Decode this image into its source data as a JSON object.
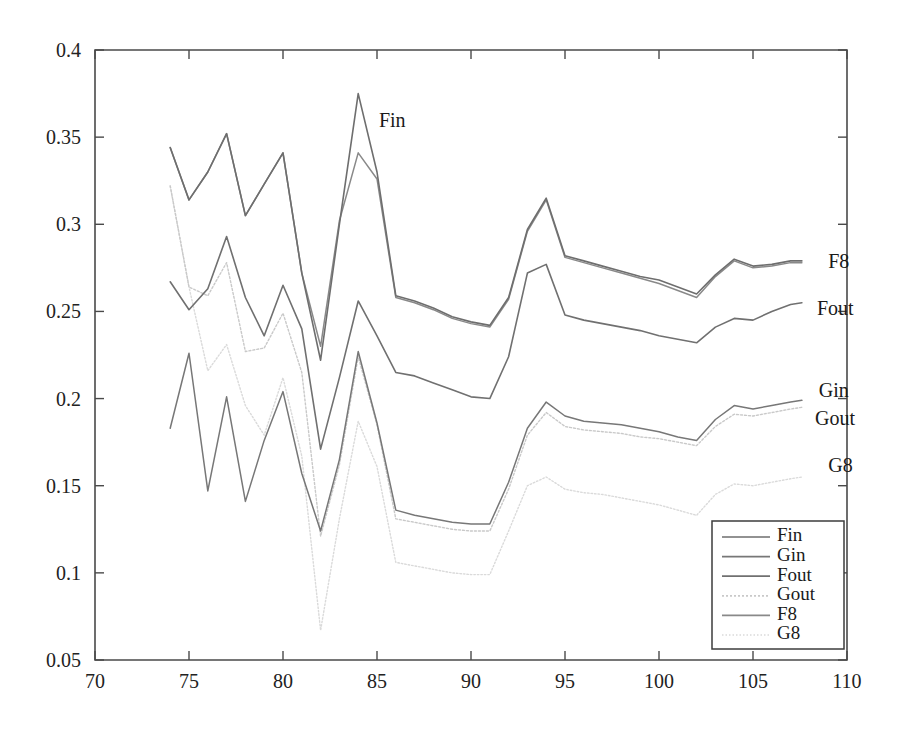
{
  "chart_data": {
    "type": "line",
    "title": "",
    "xlabel": "",
    "ylabel": "",
    "xlim": [
      70,
      110
    ],
    "ylim": [
      0.05,
      0.4
    ],
    "x_ticks": [
      70,
      75,
      80,
      85,
      90,
      95,
      100,
      105,
      110
    ],
    "y_ticks": [
      0.05,
      0.1,
      0.15,
      0.2,
      0.25,
      0.3,
      0.35,
      0.4
    ],
    "x_tick_labels": [
      "70",
      "75",
      "80",
      "85",
      "90",
      "95",
      "100",
      "105",
      "110"
    ],
    "y_tick_labels": [
      "0.05",
      "0.1",
      "0.15",
      "0.2",
      "0.25",
      "0.3",
      "0.35",
      "0.4"
    ],
    "grid": false,
    "legend_position": "lower right",
    "x": [
      74,
      75,
      76,
      77,
      78,
      79,
      80,
      81,
      82,
      83,
      84,
      85,
      86,
      87,
      88,
      89,
      90,
      91,
      92,
      93,
      94,
      95,
      96,
      97,
      98,
      99,
      100,
      101,
      102,
      103,
      104,
      105,
      106,
      107,
      107.6
    ],
    "series": [
      {
        "name": "Fin",
        "color": "#6e6e6e",
        "width": 1.6,
        "dash": "none",
        "values": [
          0.344,
          0.314,
          0.33,
          0.352,
          0.305,
          0.323,
          0.341,
          0.272,
          0.222,
          0.3,
          0.375,
          0.33,
          0.259,
          0.256,
          0.252,
          0.247,
          0.244,
          0.242,
          0.258,
          0.297,
          0.315,
          0.282,
          0.279,
          0.276,
          0.273,
          0.27,
          0.268,
          0.264,
          0.26,
          0.271,
          0.28,
          0.276,
          0.277,
          0.279,
          0.279
        ]
      },
      {
        "name": "Gin",
        "color": "#777777",
        "width": 1.5,
        "dash": "none",
        "values": [
          0.183,
          0.226,
          0.147,
          0.201,
          0.141,
          0.176,
          0.204,
          0.157,
          0.124,
          0.165,
          0.227,
          0.186,
          0.136,
          0.133,
          0.131,
          0.129,
          0.128,
          0.128,
          0.152,
          0.183,
          0.198,
          0.19,
          0.187,
          0.186,
          0.185,
          0.183,
          0.181,
          0.178,
          0.176,
          0.188,
          0.196,
          0.194,
          0.196,
          0.198,
          0.199
        ]
      },
      {
        "name": "Fout",
        "color": "#707070",
        "width": 1.6,
        "dash": "none",
        "values": [
          0.267,
          0.251,
          0.263,
          0.293,
          0.258,
          0.236,
          0.265,
          0.24,
          0.171,
          0.212,
          0.256,
          0.236,
          0.215,
          0.213,
          0.209,
          0.205,
          0.201,
          0.2,
          0.224,
          0.272,
          0.277,
          0.248,
          0.245,
          0.243,
          0.241,
          0.239,
          0.236,
          0.234,
          0.232,
          0.241,
          0.246,
          0.245,
          0.25,
          0.254,
          0.255
        ]
      },
      {
        "name": "Gout",
        "color": "#c9c9c9",
        "width": 1.4,
        "dash": "2,2",
        "values": [
          0.322,
          0.264,
          0.259,
          0.278,
          0.227,
          0.229,
          0.249,
          0.215,
          0.121,
          0.162,
          0.224,
          0.185,
          0.131,
          0.129,
          0.127,
          0.125,
          0.124,
          0.124,
          0.148,
          0.179,
          0.192,
          0.184,
          0.182,
          0.181,
          0.18,
          0.178,
          0.177,
          0.175,
          0.173,
          0.184,
          0.191,
          0.19,
          0.192,
          0.194,
          0.195
        ]
      },
      {
        "name": "F8",
        "color": "#898989",
        "width": 1.5,
        "dash": "none",
        "values": [
          0.344,
          0.314,
          0.33,
          0.352,
          0.305,
          0.323,
          0.341,
          0.272,
          0.23,
          0.302,
          0.341,
          0.326,
          0.258,
          0.255,
          0.251,
          0.246,
          0.243,
          0.241,
          0.257,
          0.296,
          0.314,
          0.281,
          0.278,
          0.275,
          0.272,
          0.269,
          0.266,
          0.262,
          0.258,
          0.27,
          0.279,
          0.275,
          0.276,
          0.278,
          0.278
        ]
      },
      {
        "name": "G8",
        "color": "#dadada",
        "width": 1.4,
        "dash": "1.5,2",
        "values": [
          0.322,
          0.264,
          0.216,
          0.231,
          0.196,
          0.179,
          0.212,
          0.167,
          0.067,
          0.131,
          0.187,
          0.161,
          0.106,
          0.104,
          0.102,
          0.1,
          0.099,
          0.099,
          0.124,
          0.15,
          0.155,
          0.148,
          0.146,
          0.145,
          0.143,
          0.141,
          0.139,
          0.136,
          0.133,
          0.145,
          0.151,
          0.15,
          0.152,
          0.154,
          0.155
        ]
      }
    ],
    "inline_annotations": [
      {
        "text": "Fin",
        "x": 85.1,
        "y": 0.356
      },
      {
        "text": "F8",
        "x": 109.0,
        "y": 0.275
      },
      {
        "text": "Fout",
        "x": 108.4,
        "y": 0.248
      },
      {
        "text": "Gin",
        "x": 108.5,
        "y": 0.201
      },
      {
        "text": "Gout",
        "x": 108.3,
        "y": 0.185
      },
      {
        "text": "G8",
        "x": 109.0,
        "y": 0.158
      }
    ],
    "legend": {
      "entries": [
        {
          "label": "Fin",
          "color": "#6e6e6e",
          "dash": "none"
        },
        {
          "label": "Gin",
          "color": "#777777",
          "dash": "none"
        },
        {
          "label": "Fout",
          "color": "#707070",
          "dash": "none"
        },
        {
          "label": "Gout",
          "color": "#c9c9c9",
          "dash": "2,2"
        },
        {
          "label": "F8",
          "color": "#898989",
          "dash": "none"
        },
        {
          "label": "G8",
          "color": "#dadada",
          "dash": "1.5,2"
        }
      ]
    }
  }
}
